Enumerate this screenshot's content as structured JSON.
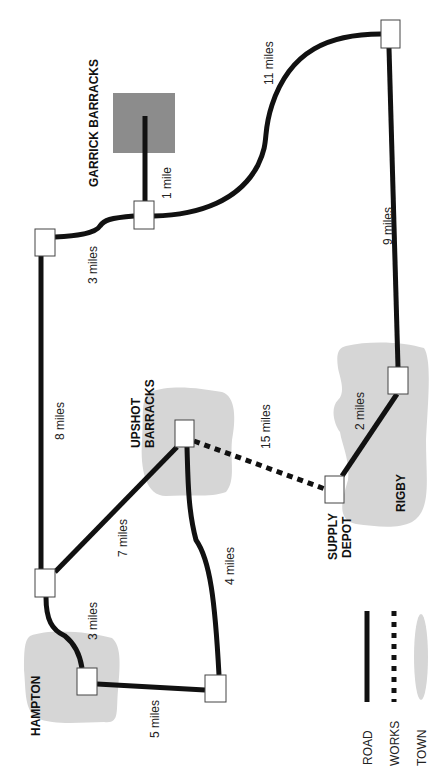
{
  "map": {
    "orientation": "rotated 90 degrees counter-clockwise",
    "places": {
      "garrick": "GARRICK BARRACKS",
      "upshot_1": "UPSHOT",
      "upshot_2": "BARRACKS",
      "hampton": "HAMPTON",
      "rigby": "RIGBY",
      "supply_1": "SUPPLY",
      "supply_2": "DEPOT"
    },
    "distances": {
      "top_right_to_garrick_junction": "11 miles",
      "garrick_spur": "1 mile",
      "top_right_to_rigby": "9 miles",
      "garrick_junction_to_top_left": "3 miles",
      "top_left_to_hampton_junction": "8 miles",
      "upshot_to_supply_works": "15 miles",
      "rigby_to_supply": "2 miles",
      "hampton_junction_to_upshot": "7 miles",
      "upshot_to_bottom_node": "4 miles",
      "hampton_junction_to_hampton": "3 miles",
      "hampton_to_bottom_node": "5 miles"
    },
    "legend": {
      "road": "ROAD",
      "works": "WORKS",
      "town": "TOWN"
    },
    "colors": {
      "road": "#111111",
      "town": "#d3d3d3",
      "barracks_block": "#8c8c8c",
      "node_fill": "#ffffff"
    }
  }
}
